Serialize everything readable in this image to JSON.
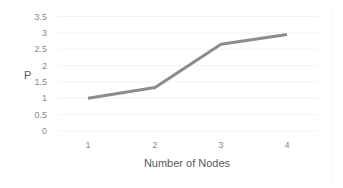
{
  "chart_data": {
    "type": "line",
    "title": "",
    "xlabel": "Number of Nodes",
    "ylabel": "P",
    "categories": [
      "1",
      "2",
      "3",
      "4"
    ],
    "x": [
      1,
      2,
      3,
      4
    ],
    "series": [
      {
        "name": "P",
        "values": [
          1.0,
          1.33,
          2.65,
          2.95
        ],
        "color": "#8c8c8c"
      }
    ],
    "ylim": [
      0,
      3.5
    ],
    "yticks": [
      "0",
      "0.5",
      "1",
      "1.5",
      "2",
      "2.5",
      "3",
      "3.5"
    ],
    "grid": true,
    "legend": "none"
  },
  "axes": {
    "y_label": "P",
    "x_label": "Number of Nodes",
    "y_ticks": [
      "0",
      "0.5",
      "1",
      "1.5",
      "2",
      "2.5",
      "3",
      "3.5"
    ],
    "x_ticks": [
      "1",
      "2",
      "3",
      "4"
    ]
  }
}
